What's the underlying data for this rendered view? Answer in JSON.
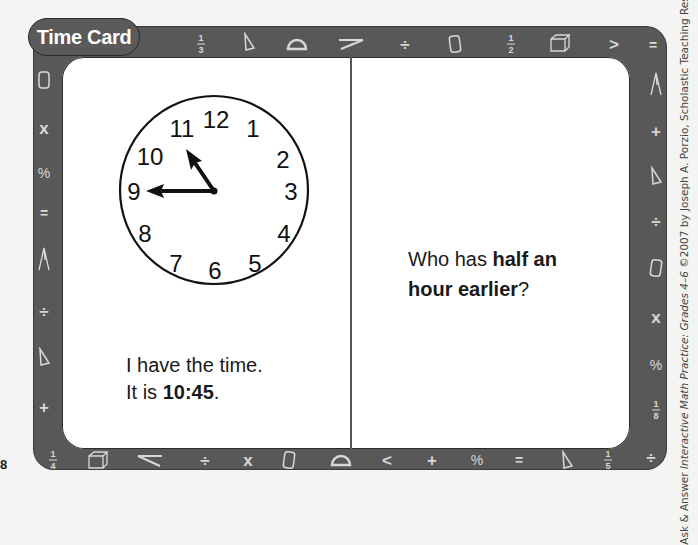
{
  "card": {
    "title": "Time Card",
    "left_panel": {
      "clock": {
        "numerals": [
          "12",
          "1",
          "2",
          "3",
          "4",
          "5",
          "6",
          "7",
          "8",
          "9",
          "10",
          "11"
        ],
        "hour_hand_points_to": "10:45",
        "minute_hand_points_to": "9"
      },
      "line1": "I have the time.",
      "line2_prefix": "It is ",
      "line2_time": "10:45",
      "line2_suffix": "."
    },
    "right_panel": {
      "prefix": "Who has ",
      "bold1": "half an",
      "bold2": "hour earlier",
      "suffix": "?"
    }
  },
  "frame_symbols": {
    "top": [
      "fraction-1/3",
      "cone",
      "protractor",
      "compass-pencil",
      "divide",
      "cylinder",
      "fraction-1/2",
      "cube",
      "greater-than",
      "equals"
    ],
    "bottom": [
      "fraction-1/4",
      "cube",
      "compass-pencil",
      "divide",
      "times",
      "cylinder",
      "protractor",
      "less-than",
      "plus",
      "percent",
      "equals",
      "cone",
      "fraction-1/5",
      "divide"
    ],
    "left": [
      "cylinder",
      "times",
      "percent",
      "equals",
      "compass",
      "divide",
      "cone",
      "plus"
    ],
    "right": [
      "compass",
      "plus",
      "cone",
      "divide",
      "cylinder",
      "times",
      "percent",
      "fraction-1/8"
    ]
  },
  "fractions": {
    "one_third": [
      "1",
      "3"
    ],
    "one_half": [
      "1",
      "2"
    ],
    "one_quarter": [
      "1",
      "4"
    ],
    "one_fifth": [
      "1",
      "5"
    ],
    "one_eighth": [
      "1",
      "8"
    ]
  },
  "glyphs": {
    "divide": "÷",
    "times": "x",
    "percent": "%",
    "equals": "=",
    "plus": "+",
    "greater": ">",
    "less": "<"
  },
  "page_number": "8",
  "credit": {
    "prefix": "Ask & Answer ",
    "italic": "Interactive Math Practice: Grades 4–6",
    "suffix": " ©2007 by Joseph A. Porzio, Scholastic Teaching Resources"
  },
  "colors": {
    "frame": "#585858",
    "symbol": "#d8d8d8",
    "card": "#ffffff",
    "ink": "#1a1a1a"
  }
}
